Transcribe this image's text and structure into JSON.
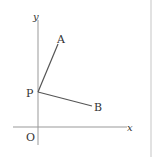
{
  "diagram": {
    "labels": {
      "y_axis": "y",
      "x_axis": "x",
      "origin": "O",
      "point_a": "A",
      "point_p": "P",
      "point_b": "B"
    },
    "colors": {
      "axis": "#999999",
      "segment": "#555555",
      "text": "#333333",
      "border": "#dddddd"
    }
  }
}
